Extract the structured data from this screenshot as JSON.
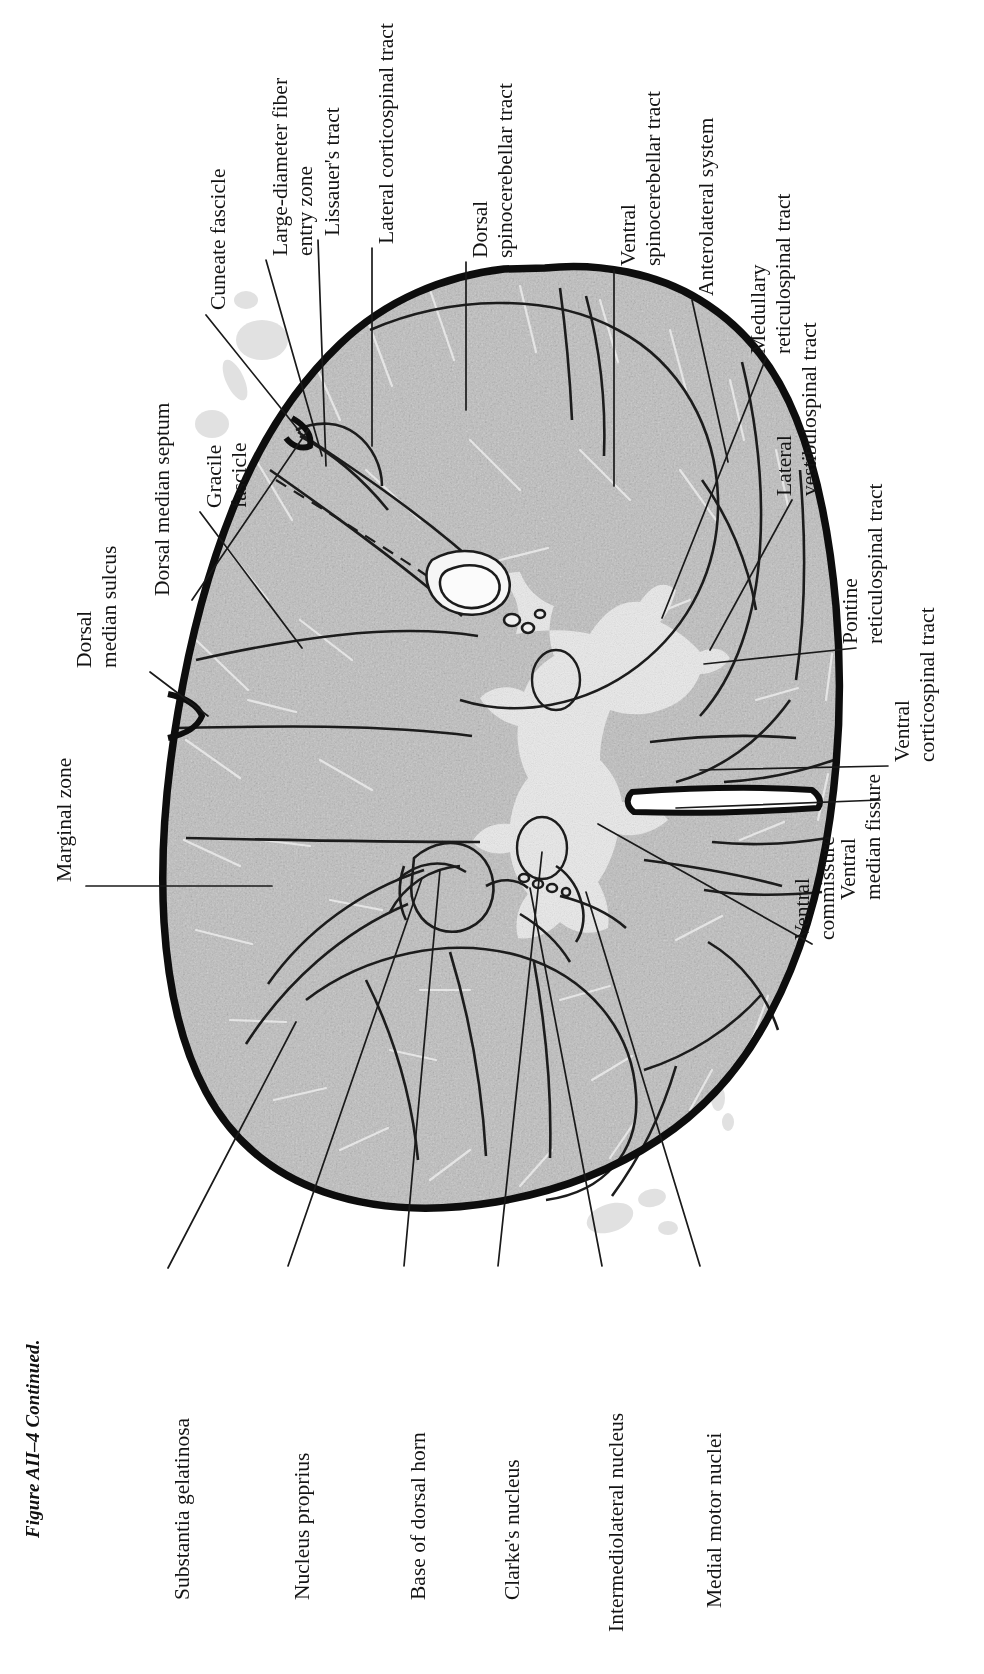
{
  "figure": {
    "caption": "Figure AII–4 Continued.",
    "orientation": "rotated 90 degrees counter-clockwise",
    "colors": {
      "background": "#ffffff",
      "tissue_fill": "#bcbcbc",
      "tissue_fill_light": "#d6d6d6",
      "gray_matter_fill": "#ececec",
      "pia_outline": "#101010",
      "leader_line": "#1a1a1a",
      "text": "#141414"
    }
  },
  "labels": {
    "cuneate_fascicle": "Cuneate fascicle",
    "large_diameter_fiber_entry_zone_l1": "Large-diameter fiber",
    "large_diameter_fiber_entry_zone_l2": "entry zone",
    "lissauers_tract": "Lissauer's tract",
    "lateral_corticospinal_tract": "Lateral corticospinal tract",
    "dorsal_spinocerebellar_tract_l1": "Dorsal",
    "dorsal_spinocerebellar_tract_l2": "spinocerebellar tract",
    "ventral_spinocerebellar_tract_l1": "Ventral",
    "ventral_spinocerebellar_tract_l2": "spinocerebellar tract",
    "anterolateral_system": "Anterolateral system",
    "medullary_reticulospinal_tract_l1": "Medullary",
    "medullary_reticulospinal_tract_l2": "reticulospinal tract",
    "lateral_vestibulospinal_tract_l1": "Lateral",
    "lateral_vestibulospinal_tract_l2": "vestibulospinal tract",
    "pontine_reticulospinal_tract_l1": "Pontine",
    "pontine_reticulospinal_tract_l2": "reticulospinal tract",
    "ventral_corticospinal_tract_l1": "Ventral",
    "ventral_corticospinal_tract_l2": "corticospinal tract",
    "ventral_median_fissure_l1": "Ventral",
    "ventral_median_fissure_l2": "median fissure",
    "ventral_commissure_l1": "Ventral",
    "ventral_commissure_l2": "commissure",
    "dorsal_median_septum": "Dorsal median septum",
    "gracile_fascicle_l1": "Gracile",
    "gracile_fascicle_l2": "fascicle",
    "dorsal_median_sulcus_l1": "Dorsal",
    "dorsal_median_sulcus_l2": "median sulcus",
    "marginal_zone": "Marginal zone",
    "substantia_gelatinosa": "Substantia gelatinosa",
    "nucleus_proprius": "Nucleus proprius",
    "base_of_dorsal_horn": "Base of dorsal horn",
    "clarkes_nucleus": "Clarke's nucleus",
    "intermediolateral_nucleus": "Intermediolateral nucleus",
    "medial_motor_nuclei": "Medial motor nuclei"
  }
}
